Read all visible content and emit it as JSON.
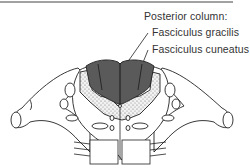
{
  "figure": {
    "title": "Posterior column:",
    "labels": [
      {
        "id": "gracilis",
        "text": "Fasciculus gracilis"
      },
      {
        "id": "cuneatus",
        "text": "Fasciculus cuneatus"
      }
    ],
    "colors": {
      "posterior_column_fill": "#5a5a5a",
      "gray_matter_stipple": "#d9d9d9",
      "line": "#222222",
      "background": "#ffffff"
    }
  }
}
